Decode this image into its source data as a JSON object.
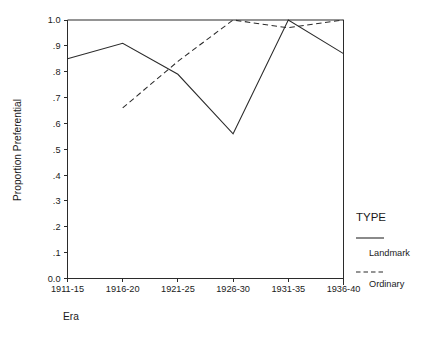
{
  "chart_data": {
    "type": "line",
    "title": "",
    "xlabel": "Era",
    "ylabel": "Proportion Preferential",
    "categories": [
      "1911-15",
      "1916-20",
      "1921-25",
      "1926-30",
      "1931-35",
      "1936-40"
    ],
    "ylim": [
      0.0,
      1.0
    ],
    "yticks": [
      "0.0",
      ".1",
      ".2",
      ".3",
      ".4",
      ".5",
      ".6",
      ".7",
      ".8",
      ".9",
      "1.0"
    ],
    "ytick_values": [
      0.0,
      0.1,
      0.2,
      0.3,
      0.4,
      0.5,
      0.6,
      0.7,
      0.8,
      0.9,
      1.0
    ],
    "grid": false,
    "legend_position": "right",
    "legend_title": "TYPE",
    "series": [
      {
        "name": "Landmark",
        "style": "solid",
        "values": [
          0.85,
          0.91,
          0.79,
          0.56,
          1.0,
          0.87
        ]
      },
      {
        "name": "Ordinary",
        "style": "dashed",
        "values": [
          null,
          0.66,
          0.84,
          1.0,
          0.97,
          1.0
        ]
      }
    ],
    "top_border_series": {
      "name": "frame-top",
      "values": [
        1.0,
        1.0,
        1.0,
        1.0,
        1.0,
        1.0
      ]
    }
  },
  "axes": {
    "y_title": "Proportion Preferential",
    "x_title": "Era"
  },
  "legend": {
    "title": "TYPE",
    "entries": [
      {
        "label": "Landmark",
        "style": "solid"
      },
      {
        "label": "Ordinary",
        "style": "dashed"
      }
    ]
  },
  "colors": {
    "line": "#2b2b2b",
    "text": "#1a1a1a",
    "background": "#ffffff"
  }
}
